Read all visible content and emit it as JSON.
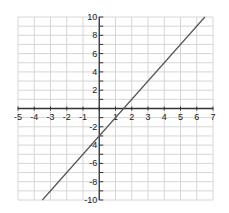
{
  "chart_data": {
    "type": "line",
    "title": "",
    "xlabel": "",
    "ylabel": "",
    "xlim": [
      -5,
      7
    ],
    "ylim": [
      -10,
      10
    ],
    "grid": true,
    "x_ticks": [
      -5,
      -4,
      -3,
      -2,
      -1,
      1,
      2,
      3,
      4,
      5,
      6,
      7
    ],
    "x_tick_labels": [
      "-5",
      "-4",
      "-3",
      "-2",
      "-1",
      "1",
      "2",
      "3",
      "4",
      "5",
      "6",
      "7"
    ],
    "y_ticks": [
      10,
      8,
      6,
      4,
      2,
      -2,
      -4,
      -6,
      -8,
      -10
    ],
    "y_tick_labels": [
      "10",
      "8",
      "6",
      "4",
      "2",
      "-2",
      "-4",
      "-6",
      "-8",
      "-10"
    ],
    "series": [
      {
        "name": "y = 2x - 3",
        "slope": 2,
        "intercept": -3,
        "x": [
          -3.5,
          6.5
        ],
        "y": [
          -10,
          10
        ],
        "color": "#555555"
      }
    ]
  }
}
